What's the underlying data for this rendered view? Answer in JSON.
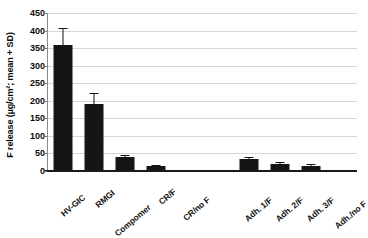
{
  "chart_data": {
    "type": "bar",
    "title": "",
    "xlabel": "",
    "ylabel": "F release (µg/cm²; mean + SD)",
    "ylim": [
      0,
      450
    ],
    "ytick_step": 50,
    "yticks": [
      450,
      400,
      350,
      300,
      250,
      200,
      150,
      100,
      50,
      0
    ],
    "grid": true,
    "legend": "none",
    "bar_color": "#151515",
    "gridline_color": "#d6d6d6",
    "axis_color": "#1a1a1a",
    "categories": [
      "HV-GIC",
      "RMGI",
      "Compomer",
      "CR/F",
      "CR/no F",
      "Adh. 1/F",
      "Adh. 2/F",
      "Adh. 3/F",
      "Adh./no F"
    ],
    "values": [
      360,
      192,
      40,
      13,
      0,
      33,
      20,
      15,
      0
    ],
    "errors": [
      45,
      28,
      4,
      2,
      0,
      4,
      3,
      2,
      0
    ],
    "gap_after_index": 4
  }
}
